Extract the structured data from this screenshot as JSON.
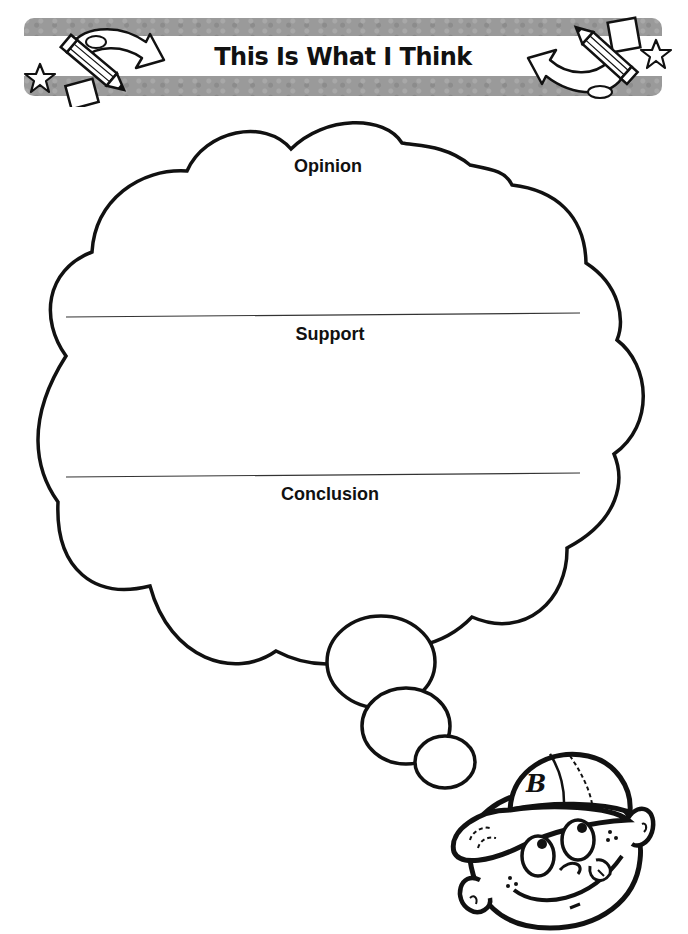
{
  "header": {
    "title": "This Is What I Think"
  },
  "organizer": {
    "sections": [
      {
        "label": "Opinion"
      },
      {
        "label": "Support"
      },
      {
        "label": "Conclusion"
      }
    ]
  },
  "colors": {
    "banner_gray": "#9a9a9a",
    "outline": "#111111"
  },
  "icons": {
    "left_decoration": "pencil-star-paper-arrow-icon",
    "right_decoration": "pencil-star-paper-arrow-icon",
    "character": "boy-in-baseball-cap-thinking"
  }
}
